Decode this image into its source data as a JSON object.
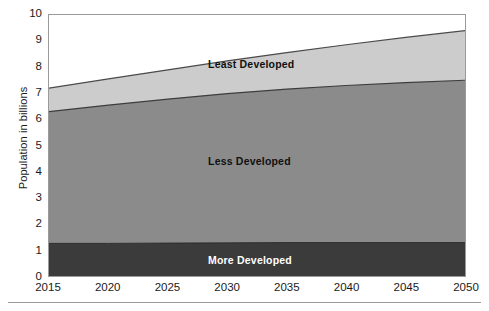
{
  "chart_data": {
    "type": "area",
    "title": "",
    "subtitle": "",
    "xlabel": "",
    "ylabel": "Population in billions",
    "xlim": [
      2015,
      2050
    ],
    "ylim": [
      0,
      10
    ],
    "grid": false,
    "legend_position": "inline-labels",
    "stacked": true,
    "x": [
      2015,
      2020,
      2025,
      2030,
      2035,
      2040,
      2045,
      2050
    ],
    "xticklabels": [
      "2015",
      "2020",
      "2025",
      "2030",
      "2035",
      "2040",
      "2045",
      "2050"
    ],
    "yticklabels": [
      "0",
      "1",
      "2",
      "3",
      "4",
      "5",
      "6",
      "7",
      "8",
      "9",
      "10"
    ],
    "yticks": [
      0,
      1,
      2,
      3,
      4,
      5,
      6,
      7,
      8,
      9,
      10
    ],
    "series": [
      {
        "name": "More Developed",
        "color": "#3b3b3b",
        "values": [
          1.25,
          1.25,
          1.26,
          1.27,
          1.28,
          1.28,
          1.28,
          1.28
        ]
      },
      {
        "name": "Less Developed",
        "color": "#8b8b8b",
        "values": [
          5.05,
          5.3,
          5.52,
          5.72,
          5.88,
          6.02,
          6.13,
          6.22
        ]
      },
      {
        "name": "Least Developed",
        "color": "#cccccc",
        "values": [
          0.9,
          1.0,
          1.12,
          1.25,
          1.4,
          1.56,
          1.73,
          1.9
        ]
      }
    ],
    "cumulative": {
      "more_developed_top": [
        1.25,
        1.25,
        1.26,
        1.27,
        1.28,
        1.28,
        1.28,
        1.28
      ],
      "less_developed_top": [
        6.3,
        6.55,
        6.78,
        6.99,
        7.16,
        7.3,
        7.41,
        7.5
      ],
      "total_top": [
        7.2,
        7.55,
        7.9,
        8.24,
        8.56,
        8.86,
        9.14,
        9.4
      ]
    },
    "annotations": [
      {
        "text": "Least Developed",
        "x": 2032,
        "y": 8.1
      },
      {
        "text": "Less Developed",
        "x": 2032,
        "y": 4.4
      },
      {
        "text": "More Developed",
        "x": 2032,
        "y": 0.65
      }
    ]
  },
  "axes": {
    "y_title": "Population in billions",
    "y_ticks": [
      "10",
      "9",
      "8",
      "7",
      "6",
      "5",
      "4",
      "3",
      "2",
      "1",
      "0"
    ],
    "x_ticks": [
      "2015",
      "2020",
      "2025",
      "2030",
      "2035",
      "2040",
      "2045",
      "2050"
    ]
  },
  "labels": {
    "least_developed": "Least Developed",
    "less_developed": "Less Developed",
    "more_developed": "More Developed"
  },
  "colors": {
    "least_developed": "#cccccc",
    "less_developed": "#8b8b8b",
    "more_developed": "#3b3b3b",
    "frame": "#9a9a9a",
    "text": "#1a1a1a"
  }
}
